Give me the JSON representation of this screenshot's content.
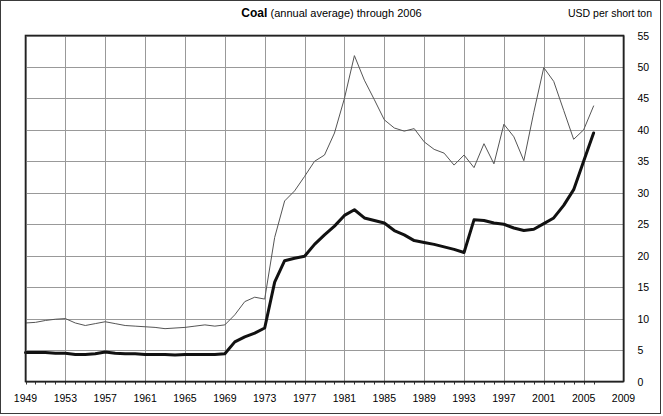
{
  "chart_title": {
    "main": "Coal",
    "sub": "(annual average) through 2006"
  },
  "units_label": "USD per short ton",
  "chart_data": {
    "type": "line",
    "title": "Coal  (annual average) through 2006",
    "subtitle": "(annual average) through 2006",
    "xlabel": "",
    "ylabel": "USD per short ton",
    "xlim": [
      1949,
      2009
    ],
    "ylim": [
      0,
      55
    ],
    "grid": true,
    "legend_position": "none",
    "xticks": [
      1949,
      1953,
      1957,
      1961,
      1965,
      1969,
      1973,
      1977,
      1981,
      1985,
      1989,
      1993,
      1997,
      2001,
      2005,
      2009
    ],
    "yticks": [
      0,
      5,
      10,
      15,
      20,
      25,
      30,
      35,
      40,
      45,
      50,
      55
    ],
    "x": [
      1949,
      1950,
      1951,
      1952,
      1953,
      1954,
      1955,
      1956,
      1957,
      1958,
      1959,
      1960,
      1961,
      1962,
      1963,
      1964,
      1965,
      1966,
      1967,
      1968,
      1969,
      1970,
      1971,
      1972,
      1973,
      1974,
      1975,
      1976,
      1977,
      1978,
      1979,
      1980,
      1981,
      1982,
      1983,
      1984,
      1985,
      1986,
      1987,
      1988,
      1989,
      1990,
      1991,
      1992,
      1993,
      1994,
      1995,
      1996,
      1997,
      1998,
      1999,
      2000,
      2001,
      2002,
      2003,
      2004,
      2005,
      2006
    ],
    "series": [
      {
        "name": "Real price (inflation adjusted)",
        "style": "thin",
        "color": "#555555",
        "width": 1,
        "values": [
          9.3,
          9.4,
          9.7,
          9.9,
          10.0,
          9.3,
          8.9,
          9.2,
          9.5,
          9.2,
          8.9,
          8.8,
          8.7,
          8.6,
          8.4,
          8.5,
          8.6,
          8.8,
          9.0,
          8.8,
          9.0,
          10.6,
          12.7,
          13.4,
          13.1,
          22.9,
          28.7,
          30.3,
          32.6,
          35.0,
          36.0,
          39.5,
          45.0,
          51.8,
          47.9,
          44.8,
          41.6,
          40.3,
          39.8,
          40.2,
          38.1,
          36.9,
          36.3,
          34.4,
          36.0,
          34.0,
          37.8,
          34.6,
          40.9,
          38.9,
          35.1,
          42.8,
          49.9,
          47.7,
          43.1,
          38.5,
          40.0,
          43.8
        ]
      },
      {
        "name": "Nominal price",
        "style": "thick",
        "color": "#111111",
        "width": 3,
        "values": [
          4.6,
          4.6,
          4.6,
          4.5,
          4.5,
          4.3,
          4.3,
          4.4,
          4.7,
          4.5,
          4.4,
          4.4,
          4.3,
          4.3,
          4.3,
          4.2,
          4.3,
          4.3,
          4.3,
          4.3,
          4.4,
          6.3,
          7.1,
          7.7,
          8.5,
          15.8,
          19.2,
          19.6,
          19.9,
          21.8,
          23.3,
          24.7,
          26.4,
          27.3,
          26.0,
          25.6,
          25.2,
          24.0,
          23.3,
          22.4,
          22.1,
          21.8,
          21.4,
          21.0,
          20.5,
          25.7,
          25.6,
          25.2,
          25.0,
          24.4,
          24.0,
          24.2,
          25.1,
          26.0,
          28.0,
          30.5,
          35.0,
          39.5
        ]
      }
    ]
  }
}
